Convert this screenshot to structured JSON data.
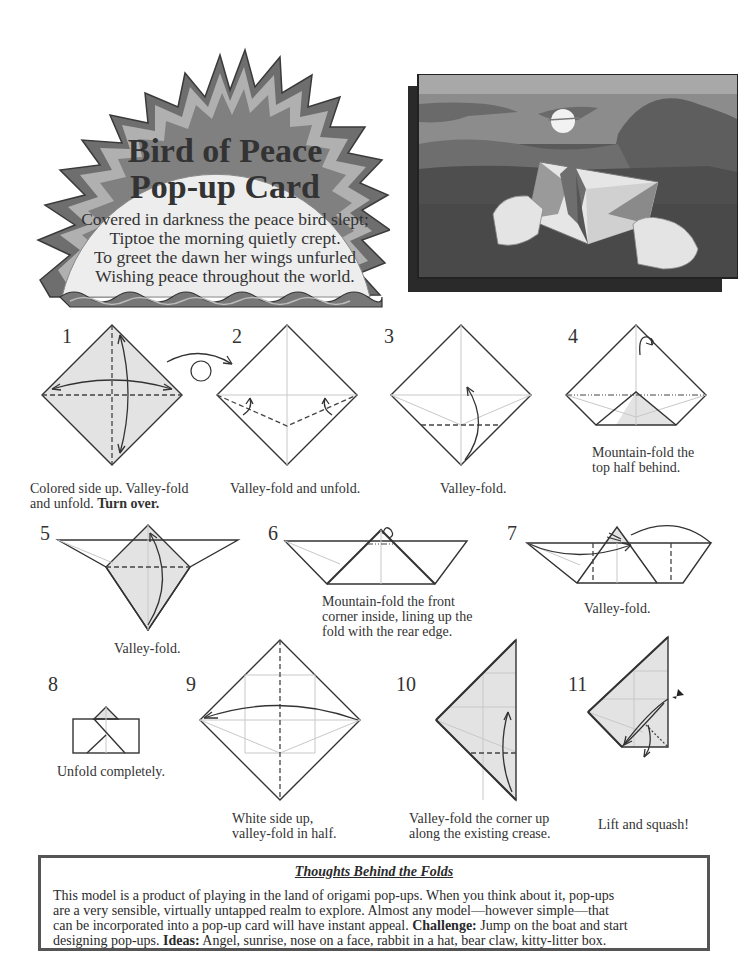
{
  "header": {
    "title_line1": "Bird of Peace",
    "title_line2": "Pop-up Card",
    "poem": [
      "Covered in darkness the peace bird slept;",
      "Tiptoe the morning quietly crept.",
      "To greet the dawn her wings unfurled",
      "Wishing peace throughout the world."
    ]
  },
  "photo": {
    "description": "Hands holding a white origami pop-up card with a bird silhouette in front of a moonlit mountain landscape"
  },
  "colors": {
    "paper_shade": "#e3e3e3",
    "line": "#333333",
    "crease": "#c8c8c8",
    "photo_sky": "#8a8a8a",
    "photo_ground": "#4a4a4a"
  },
  "steps": [
    {
      "num": "1",
      "caption_line1": "Colored side up.  Valley-fold",
      "caption_line2_plain": "and unfold.  ",
      "caption_line2_bold": "Turn over."
    },
    {
      "num": "2",
      "caption": "Valley-fold and unfold."
    },
    {
      "num": "3",
      "caption": "Valley-fold."
    },
    {
      "num": "4",
      "caption_line1": "Mountain-fold the",
      "caption_line2": "top half behind."
    },
    {
      "num": "5",
      "caption": "Valley-fold."
    },
    {
      "num": "6",
      "caption_line1": "Mountain-fold the front",
      "caption_line2": "corner inside, lining up the",
      "caption_line3": "fold with the rear edge."
    },
    {
      "num": "7",
      "caption": "Valley-fold."
    },
    {
      "num": "8",
      "caption": "Unfold completely."
    },
    {
      "num": "9",
      "caption_line1": "White side up,",
      "caption_line2": "valley-fold in half."
    },
    {
      "num": "10",
      "caption_line1": "Valley-fold the corner up",
      "caption_line2": "along the existing crease."
    },
    {
      "num": "11",
      "caption": "Lift and squash!"
    }
  ],
  "notes": {
    "title": "Thoughts Behind the Folds",
    "line1": "This model is a product of playing in the land of origami pop-ups.  When you think about it, pop-ups",
    "line2": "are a very sensible, virtually untapped realm to explore.  Almost any model—however simple—that",
    "line3_plain": "can be incorporated into a pop-up card will have instant appeal.  ",
    "line3_bold": "Challenge:",
    "line3_rest": " Jump on the boat and start",
    "line4_plain": "designing pop-ups.  ",
    "line4_bold": "Ideas:",
    "line4_rest": " Angel, sunrise, nose on a face, rabbit in a hat, bear claw, kitty-litter box."
  }
}
